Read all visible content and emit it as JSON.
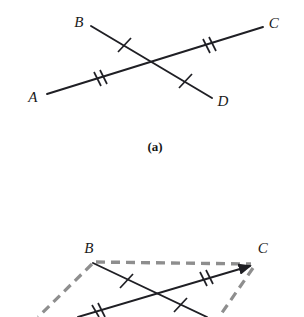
{
  "figure": {
    "background_color": "#ffffff",
    "stroke_color": "#1f1f24",
    "dashed_color": "#8e8e8e",
    "label_color": "#1a1a1a"
  },
  "panel_a": {
    "caption": "(a)",
    "caption_pos": {
      "x": 155,
      "y": 146
    },
    "labels": [
      {
        "name": "A",
        "text": "A",
        "x": 33,
        "y": 97
      },
      {
        "name": "B",
        "text": "B",
        "x": 79,
        "y": 22
      },
      {
        "name": "C",
        "text": "C",
        "x": 274,
        "y": 23
      },
      {
        "name": "D",
        "text": "D",
        "x": 223,
        "y": 101
      }
    ],
    "segments": [
      {
        "name": "segment-AC",
        "from": "A",
        "to": "C",
        "x1": 47,
        "y1": 94,
        "x2": 263,
        "y2": 27,
        "style": "solid"
      },
      {
        "name": "segment-BD",
        "from": "B",
        "to": "D",
        "x1": 91,
        "y1": 26,
        "x2": 212,
        "y2": 98,
        "style": "solid"
      }
    ],
    "intersection": {
      "x": 162,
      "y": 62
    },
    "tick_marks": [
      {
        "name": "tick-AO",
        "segment": "segment-AC",
        "count": 2,
        "x": 99,
        "y": 78
      },
      {
        "name": "tick-OC",
        "segment": "segment-AC",
        "count": 2,
        "x": 208,
        "y": 45
      },
      {
        "name": "tick-BO",
        "segment": "segment-BD",
        "count": 1,
        "x": 124,
        "y": 45
      },
      {
        "name": "tick-OD",
        "segment": "segment-BD",
        "count": 1,
        "x": 185,
        "y": 81
      }
    ]
  },
  "panel_b": {
    "labels": [
      {
        "name": "B",
        "text": "B",
        "x": 89,
        "y": 248
      },
      {
        "name": "C",
        "text": "C",
        "x": 263,
        "y": 248
      }
    ],
    "segments": [
      {
        "name": "segment-BD-lower",
        "from": "B",
        "to": "D",
        "x1": 93,
        "y1": 263,
        "x2": 207,
        "y2": 317,
        "style": "solid"
      },
      {
        "name": "segment-AC-lower",
        "from": "A",
        "to": "C",
        "x1": 78,
        "y1": 317,
        "x2": 255,
        "y2": 265,
        "style": "solid",
        "arrow_at_end": true
      }
    ],
    "dashed_segments": [
      {
        "name": "dashed-BC",
        "x1": 96,
        "y1": 262,
        "x2": 253,
        "y2": 264
      },
      {
        "name": "dashed-BA",
        "x1": 92,
        "y1": 263,
        "x2": 38,
        "y2": 317
      },
      {
        "name": "dashed-CD",
        "x1": 254,
        "y1": 267,
        "x2": 219,
        "y2": 317
      }
    ],
    "tick_marks": [
      {
        "name": "tick-BO-lower",
        "segment": "segment-BD-lower",
        "count": 1,
        "x": 126,
        "y": 281
      },
      {
        "name": "tick-OC-lower",
        "segment": "segment-AC-lower",
        "count": 2,
        "x": 205,
        "y": 279
      },
      {
        "name": "tick-AO-lower",
        "segment": "segment-AC-lower",
        "count": 2,
        "x": 97,
        "y": 312
      },
      {
        "name": "tick-OD-lower",
        "segment": "segment-BD-lower",
        "count": 1,
        "x": 180,
        "y": 305
      }
    ],
    "intersection": {
      "x": 152,
      "y": 292
    }
  }
}
